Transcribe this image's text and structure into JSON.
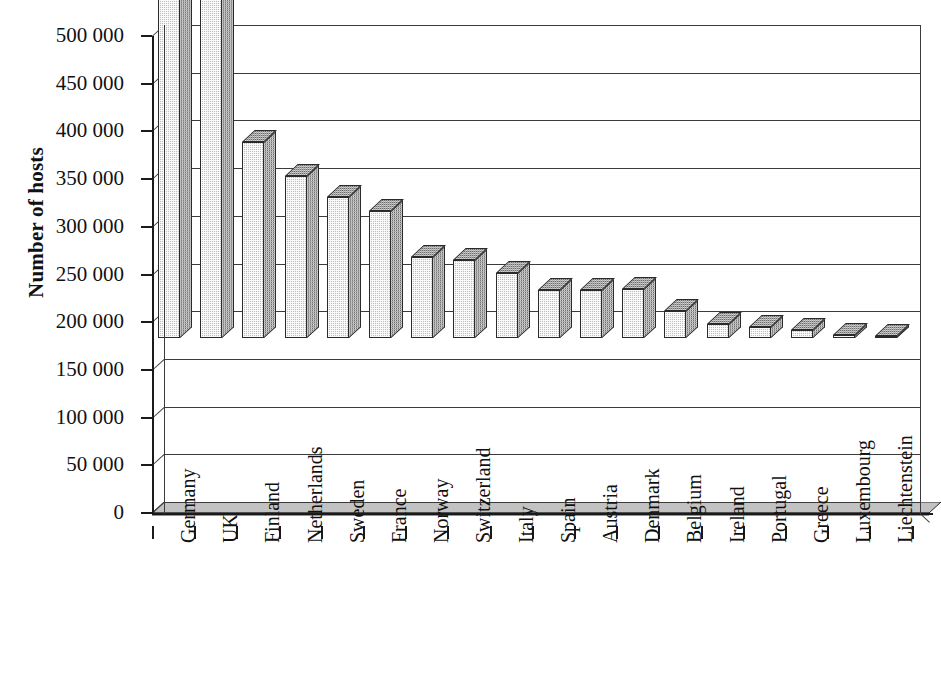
{
  "chart_data": {
    "type": "bar",
    "title": "",
    "subtitle": "",
    "xlabel": "",
    "ylabel": "Number of hosts",
    "ylim": [
      0,
      500000
    ],
    "ytick_values": [
      0,
      50000,
      100000,
      150000,
      200000,
      250000,
      300000,
      350000,
      400000,
      450000,
      500000
    ],
    "ytick_labels": [
      "0",
      "50 000",
      "100 000",
      "150 000",
      "200 000",
      "250 000",
      "300 000",
      "350 000",
      "400 000",
      "450 000",
      "500 000"
    ],
    "grid": true,
    "grid_axis": "y",
    "legend": false,
    "style_3d": true,
    "bar_fill": "#bfbfbf",
    "bar_side_fill": "#6e6e6e",
    "axis_color": "#1a1a1a",
    "background": "#ffffff",
    "categories": [
      "Germany",
      "UK",
      "Finland",
      "Netherlands",
      "Sweden",
      "France",
      "Norway",
      "Switzerland",
      "Italy",
      "Spain",
      "Austria",
      "Denmark",
      "Belgium",
      "Ireland",
      "Portugal",
      "Greece",
      "Luxembourg",
      "Liechtenstein"
    ],
    "values": [
      452000,
      450000,
      205000,
      170000,
      148000,
      133000,
      85000,
      82000,
      68000,
      50000,
      50000,
      51000,
      28000,
      15000,
      12000,
      8000,
      3000,
      1000
    ]
  },
  "axis": {
    "y_title": "Number of hosts"
  }
}
